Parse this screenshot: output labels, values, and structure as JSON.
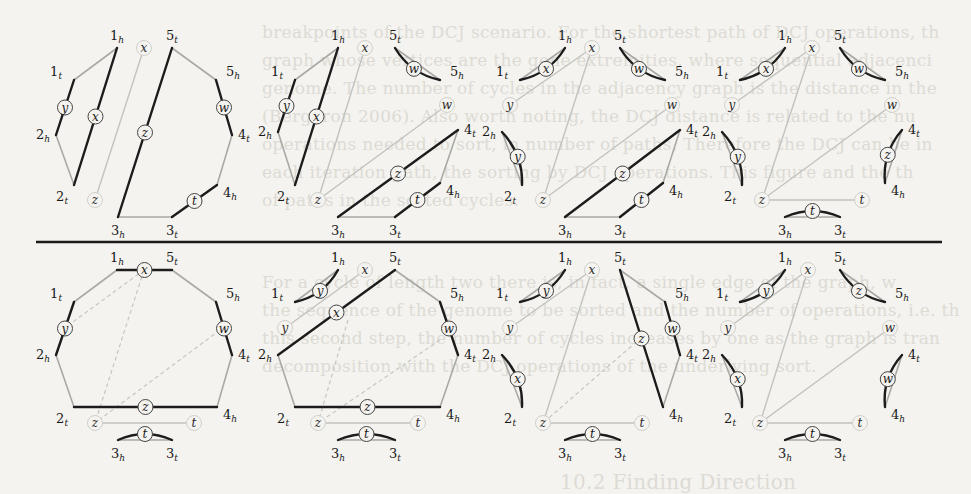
{
  "figure": {
    "vertex_labels": [
      "1t",
      "1h",
      "2h",
      "2t",
      "3h",
      "3t",
      "4h",
      "4t",
      "5h",
      "5t"
    ],
    "aux_node_labels": [
      "x",
      "y",
      "z",
      "w",
      "t"
    ],
    "colors": {
      "background": "#f4f3ef",
      "dark_edge": "#1c1c1c",
      "light_edge": "#a9a9a6",
      "aux_edge": "#c2c2be"
    }
  },
  "bleed_text": [
    "breakpoints of the DCJ scenario. For the shortest path of DCJ operations, th",
    "graph whose vertices are the gene extremities, where sequential adjacenci",
    "genome. The number of cycles in the adjacency graph is the distance in the",
    "(Bergeron 2006). Also worth noting, the DCJ distance is related to the nu",
    "operations needed to sort, in number of paths, Therefore the DCJ can be in",
    "each iteration path, the sorting by DCJ operations. This figure and the th",
    "of paths in the sorted cycles.",
    "For a cycle of length two there is, in fact, a single edge of the graph, w",
    "the sequence of the genome to be sorted and the number of operations, i.e. th",
    "this second step, the number of cycles increases by one as the graph is tran",
    "decomposition with the DCJ operations of the underlying sort.",
    "10.2  Finding Direction"
  ],
  "panels": [
    {
      "id": "top-1",
      "vertices": {
        "1t": [
          74,
          80
        ],
        "1h": [
          117,
          48
        ],
        "5t": [
          172,
          48
        ],
        "5h": [
          216,
          80
        ],
        "4t": [
          232,
          135
        ],
        "4h": [
          217,
          185
        ],
        "3t": [
          172,
          217
        ],
        "3h": [
          118,
          217
        ],
        "2t": [
          74,
          185
        ],
        "2h": [
          56,
          135
        ]
      },
      "dark_edges": [
        [
          "1t",
          "2h",
          "y"
        ],
        [
          "1h",
          "2t",
          "x"
        ],
        [
          "5t",
          "3h",
          "z"
        ],
        [
          "5h",
          "4t",
          "w"
        ],
        [
          "4h",
          "3t",
          "t"
        ]
      ],
      "light_edges": [
        [
          "1t",
          "1h"
        ],
        [
          "2h",
          "2t"
        ],
        [
          "5t",
          "5h"
        ],
        [
          "4t",
          "4h"
        ],
        [
          "3t",
          "3h"
        ]
      ],
      "aux_nodes": {
        "x": [
          144,
          48
        ],
        "z": [
          95,
          200
        ]
      },
      "aux_edges": [
        [
          "x",
          "z"
        ]
      ],
      "dashed": []
    },
    {
      "id": "top-2",
      "vertices": {
        "1t": [
          295,
          80
        ],
        "1h": [
          338,
          48
        ],
        "5t": [
          395,
          48
        ],
        "5h": [
          440,
          80
        ],
        "4t": [
          458,
          130
        ],
        "4h": [
          440,
          183
        ],
        "3t": [
          395,
          217
        ],
        "3h": [
          338,
          217
        ],
        "2t": [
          295,
          185
        ],
        "2h": [
          278,
          132
        ]
      },
      "dark_edges": [
        [
          "1t",
          "2h",
          "y"
        ],
        [
          "1h",
          "2t",
          "x"
        ],
        [
          "4t",
          "3h",
          "z"
        ],
        [
          "4h",
          "3t",
          "t"
        ]
      ],
      "curved_dark": [
        [
          "5t",
          "5h",
          "w"
        ]
      ],
      "light_edges": [
        [
          "1t",
          "1h"
        ],
        [
          "2h",
          "2t"
        ],
        [
          "4t",
          "4h"
        ],
        [
          "3t",
          "3h"
        ]
      ],
      "aux_nodes": {
        "x": [
          365,
          48
        ],
        "w": [
          447,
          105
        ],
        "z": [
          318,
          200
        ]
      },
      "aux_edges": [
        [
          "x",
          "z"
        ],
        [
          "w",
          "z"
        ]
      ],
      "dashed": []
    },
    {
      "id": "top-3",
      "vertices": {
        "1t": [
          520,
          80
        ],
        "1h": [
          565,
          48
        ],
        "5t": [
          620,
          48
        ],
        "5h": [
          665,
          80
        ],
        "4t": [
          680,
          130
        ],
        "4h": [
          663,
          183
        ],
        "3t": [
          620,
          217
        ],
        "3h": [
          565,
          217
        ],
        "2t": [
          522,
          185
        ],
        "2h": [
          502,
          132
        ]
      },
      "dark_edges": [
        [
          "4t",
          "3h",
          "z"
        ],
        [
          "4h",
          "3t",
          "t"
        ]
      ],
      "curved_dark": [
        [
          "1t",
          "1h",
          "x"
        ],
        [
          "5t",
          "5h",
          "w"
        ],
        [
          "2h",
          "2t",
          "y"
        ]
      ],
      "light_edges": [
        [
          "4t",
          "4h"
        ],
        [
          "3t",
          "3h"
        ]
      ],
      "aux_nodes": {
        "x": [
          592,
          48
        ],
        "y": [
          510,
          105
        ],
        "w": [
          672,
          105
        ],
        "z": [
          543,
          200
        ]
      },
      "aux_edges": [
        [
          "x",
          "y"
        ],
        [
          "x",
          "z"
        ],
        [
          "w",
          "z"
        ]
      ],
      "dashed": []
    },
    {
      "id": "top-4",
      "vertices": {
        "1t": [
          740,
          80
        ],
        "1h": [
          785,
          48
        ],
        "5t": [
          840,
          48
        ],
        "5h": [
          885,
          80
        ],
        "4t": [
          902,
          130
        ],
        "4h": [
          885,
          183
        ],
        "3t": [
          840,
          217
        ],
        "3h": [
          785,
          217
        ],
        "2t": [
          742,
          185
        ],
        "2h": [
          722,
          132
        ]
      },
      "dark_edges": [],
      "curved_dark": [
        [
          "1t",
          "1h",
          "x"
        ],
        [
          "5t",
          "5h",
          "w"
        ],
        [
          "2h",
          "2t",
          "y"
        ],
        [
          "4t",
          "4h",
          "z"
        ],
        [
          "3h",
          "3t",
          "t"
        ]
      ],
      "light_edges": [],
      "aux_nodes": {
        "x": [
          812,
          48
        ],
        "y": [
          732,
          105
        ],
        "w": [
          892,
          105
        ],
        "z": [
          762,
          200
        ],
        "t": [
          862,
          200
        ]
      },
      "aux_edges": [
        [
          "x",
          "y"
        ],
        [
          "x",
          "z"
        ],
        [
          "w",
          "z"
        ],
        [
          "z",
          "t"
        ]
      ],
      "dashed": []
    },
    {
      "id": "bottom-1",
      "vertices": {
        "1t": [
          74,
          302
        ],
        "1h": [
          117,
          270
        ],
        "5t": [
          172,
          270
        ],
        "5h": [
          216,
          302
        ],
        "4t": [
          232,
          355
        ],
        "4h": [
          217,
          407
        ],
        "3t": [
          172,
          440
        ],
        "3h": [
          118,
          440
        ],
        "2t": [
          74,
          407
        ],
        "2h": [
          56,
          355
        ]
      },
      "dark_edges": [
        [
          "1h",
          "5t",
          "x"
        ],
        [
          "1t",
          "2h",
          "y"
        ],
        [
          "5h",
          "4t",
          "w"
        ],
        [
          "2t",
          "4h",
          "z"
        ]
      ],
      "curved_dark": [
        [
          "3h",
          "3t",
          "t"
        ]
      ],
      "light_edges": [
        [
          "1t",
          "1h"
        ],
        [
          "5t",
          "5h"
        ],
        [
          "4t",
          "4h"
        ],
        [
          "2h",
          "2t"
        ]
      ],
      "aux_nodes": {
        "z": [
          95,
          423
        ],
        "t": [
          194,
          423
        ]
      },
      "aux_edges": [
        [
          "z",
          "t"
        ]
      ],
      "dashed": [
        [
          [
            144,
            270
          ],
          [
            95,
            423
          ]
        ],
        [
          [
            62,
            330
          ],
          [
            144,
            270
          ]
        ],
        [
          [
            220,
            330
          ],
          [
            95,
            423
          ]
        ]
      ]
    },
    {
      "id": "bottom-2",
      "vertices": {
        "1t": [
          295,
          302
        ],
        "1h": [
          338,
          270
        ],
        "5t": [
          395,
          270
        ],
        "5h": [
          440,
          302
        ],
        "4t": [
          458,
          355
        ],
        "4h": [
          440,
          407
        ],
        "3t": [
          395,
          440
        ],
        "3h": [
          338,
          440
        ],
        "2t": [
          295,
          407
        ],
        "2h": [
          278,
          355
        ]
      },
      "dark_edges": [
        [
          "5t",
          "2h",
          "x"
        ],
        [
          "5h",
          "4t",
          "w"
        ],
        [
          "2t",
          "4h",
          "z"
        ]
      ],
      "curved_dark": [
        [
          "1t",
          "1h",
          "y"
        ],
        [
          "3h",
          "3t",
          "t"
        ]
      ],
      "light_edges": [
        [
          "5t",
          "5h"
        ],
        [
          "4t",
          "4h"
        ],
        [
          "2h",
          "2t"
        ]
      ],
      "aux_nodes": {
        "x": [
          365,
          270
        ],
        "y": [
          285,
          328
        ],
        "z": [
          318,
          423
        ],
        "t": [
          418,
          423
        ]
      },
      "aux_edges": [
        [
          "x",
          "y"
        ],
        [
          "z",
          "t"
        ]
      ],
      "dashed": [
        [
          [
            348,
            320
          ],
          [
            318,
            423
          ]
        ],
        [
          [
            440,
            340
          ],
          [
            318,
            423
          ]
        ]
      ]
    },
    {
      "id": "bottom-3",
      "vertices": {
        "1t": [
          520,
          302
        ],
        "1h": [
          565,
          270
        ],
        "5t": [
          620,
          270
        ],
        "5h": [
          665,
          302
        ],
        "4t": [
          680,
          355
        ],
        "4h": [
          663,
          407
        ],
        "3t": [
          620,
          440
        ],
        "3h": [
          565,
          440
        ],
        "2t": [
          522,
          407
        ],
        "2h": [
          502,
          355
        ]
      },
      "dark_edges": [
        [
          "5t",
          "4h",
          "z"
        ],
        [
          "5h",
          "4t",
          "w"
        ]
      ],
      "curved_dark": [
        [
          "1t",
          "1h",
          "y"
        ],
        [
          "2h",
          "2t",
          "x"
        ],
        [
          "3h",
          "3t",
          "t"
        ]
      ],
      "light_edges": [
        [
          "5t",
          "5h"
        ],
        [
          "4t",
          "4h"
        ]
      ],
      "aux_nodes": {
        "x": [
          592,
          270
        ],
        "y": [
          510,
          328
        ],
        "z": [
          543,
          423
        ],
        "t": [
          642,
          423
        ]
      },
      "aux_edges": [
        [
          "x",
          "y"
        ],
        [
          "x",
          "z"
        ],
        [
          "z",
          "t"
        ]
      ],
      "dashed": [
        [
          [
            642,
            337
          ],
          [
            543,
            423
          ]
        ]
      ]
    },
    {
      "id": "bottom-4",
      "vertices": {
        "1t": [
          740,
          302
        ],
        "1h": [
          785,
          270
        ],
        "5t": [
          840,
          270
        ],
        "5h": [
          885,
          302
        ],
        "4t": [
          902,
          355
        ],
        "4h": [
          885,
          407
        ],
        "3t": [
          840,
          440
        ],
        "3h": [
          785,
          440
        ],
        "2t": [
          742,
          407
        ],
        "2h": [
          722,
          355
        ]
      },
      "dark_edges": [],
      "curved_dark": [
        [
          "1t",
          "1h",
          "y"
        ],
        [
          "5t",
          "5h",
          "z"
        ],
        [
          "2h",
          "2t",
          "x"
        ],
        [
          "4t",
          "4h",
          "w"
        ],
        [
          "3h",
          "3t",
          "t"
        ]
      ],
      "light_edges": [],
      "aux_nodes": {
        "x": [
          808,
          270
        ],
        "y": [
          728,
          328
        ],
        "w": [
          890,
          328
        ],
        "z": [
          760,
          423
        ],
        "t": [
          860,
          423
        ]
      },
      "aux_edges": [
        [
          "x",
          "y"
        ],
        [
          "x",
          "z"
        ],
        [
          "w",
          "z"
        ],
        [
          "z",
          "t"
        ]
      ],
      "dashed": []
    }
  ],
  "rule": {
    "x1": 36,
    "x2": 942,
    "y": 242
  }
}
